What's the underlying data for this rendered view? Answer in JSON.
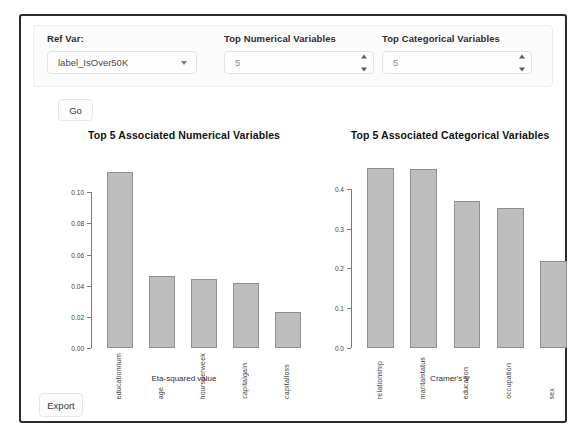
{
  "controls": {
    "ref_var": {
      "label": "Ref Var:",
      "value": "label_IsOver50K",
      "caret_icon": "chevron-down-icon"
    },
    "top_numerical": {
      "label": "Top Numerical Variables",
      "value": "5"
    },
    "top_categorical": {
      "label": "Top Categorical Variables",
      "value": "5"
    }
  },
  "buttons": {
    "go": "Go",
    "export": "Export"
  },
  "chart_data": [
    {
      "type": "bar",
      "id": "numerical",
      "title": "Top 5 Associated Numerical Variables",
      "categories": [
        "educationnum",
        "age",
        "hoursperweek",
        "capitalgain",
        "capitalloss"
      ],
      "values": [
        0.113,
        0.0465,
        0.0445,
        0.042,
        0.023
      ],
      "xlabel": "Eta-squared value",
      "ylabel": "",
      "ylim": [
        0.0,
        0.12
      ],
      "yticks": [
        0.0,
        0.02,
        0.04,
        0.06,
        0.08,
        0.1
      ],
      "ytick_labels": [
        "0.00",
        "0.02",
        "0.04",
        "0.06",
        "0.08",
        "0.10"
      ],
      "grid": false,
      "legend": "none",
      "bar_fill": "#bdbdbd",
      "bar_stroke": "#8f8f8f"
    },
    {
      "type": "bar",
      "id": "categorical",
      "title": "Top 5 Associated Categorical Variables",
      "categories": [
        "relationship",
        "maritalstatus",
        "education",
        "occupation",
        "sex"
      ],
      "values": [
        0.452,
        0.449,
        0.37,
        0.353,
        0.219
      ],
      "xlabel": "Cramer's V",
      "ylabel": "",
      "ylim": [
        0.0,
        0.47
      ],
      "yticks": [
        0.0,
        0.1,
        0.2,
        0.3,
        0.4
      ],
      "ytick_labels": [
        "0.0",
        "0.1",
        "0.2",
        "0.3",
        "0.4"
      ],
      "grid": false,
      "legend": "none",
      "bar_fill": "#bdbdbd",
      "bar_stroke": "#8f8f8f"
    }
  ]
}
